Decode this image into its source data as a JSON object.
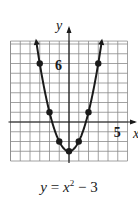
{
  "chart_data": {
    "type": "line",
    "xlabel": "x",
    "ylabel": "y",
    "xlim": [
      -6,
      6
    ],
    "ylim": [
      -4,
      8.3
    ],
    "grid": true,
    "tick_labels": {
      "x": [
        "5"
      ],
      "y": [
        "6"
      ]
    },
    "x": [
      -3,
      -2,
      -1,
      0,
      1,
      2,
      3
    ],
    "series": [
      {
        "name": "y = x^2 - 3",
        "values": [
          6,
          1,
          -2,
          -3,
          -2,
          1,
          6
        ]
      }
    ],
    "arrows_on_ends": true
  },
  "caption": {
    "y": "y",
    "eq": " = ",
    "x": "x",
    "exp": "2",
    "rest": " − 3"
  },
  "colors": {
    "grid": "#8a8a8a",
    "axis": "#1a1a1a",
    "curve": "#1a1a1a",
    "background": "#ffffff"
  }
}
